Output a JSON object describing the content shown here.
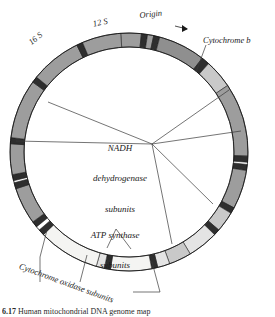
{
  "figure": {
    "caption_label": "6.17",
    "caption_text": "Human mitochondrial DNA genome map"
  },
  "diagram": {
    "type": "circular-genome-map",
    "center": {
      "x": 129,
      "y": 152
    },
    "outer_radius": 119,
    "ring_width": 14,
    "colors": {
      "mid_gray": "#9d9d9d",
      "light_gray": "#c9c9c9",
      "pale_gray": "#e4e4e4",
      "near_white": "#f4f4f2",
      "dark_band": "#2e2e2e",
      "outline": "#1a1a1a",
      "leader_line": "#3a3a3a"
    },
    "labels": [
      {
        "id": "16S",
        "text": "16 S",
        "style": "italic",
        "rotation": -40
      },
      {
        "id": "12S",
        "text": "12 S",
        "style": "italic",
        "rotation": -13
      },
      {
        "id": "origin",
        "text": "Origin",
        "style": "italic",
        "rotation": -6,
        "has_arrow": true
      },
      {
        "id": "cytochrome-b",
        "text": "Cytochrome b",
        "style": "italic",
        "rotation": 0
      },
      {
        "id": "nadh",
        "text": "NADH\ndehydrogenase\nsubunits",
        "style": "italic",
        "rotation": 0
      },
      {
        "id": "atp-synthase",
        "text": "ATP synthase\nsubunits",
        "style": "italic",
        "rotation": 0
      },
      {
        "id": "cytochrome-oxidase",
        "text": "Cytochrome oxidase subunits",
        "style": "italic",
        "rotation": 20
      }
    ],
    "label_text": {
      "rrna_16s": "16 S",
      "rrna_12s": "12 S",
      "origin": "Origin",
      "cytochrome_b": "Cytochrome b",
      "nadh_line1": "NADH",
      "nadh_line2": "dehydrogenase",
      "nadh_line3": "subunits",
      "atp_line1": "ATP synthase",
      "atp_line2": "subunits",
      "cytochrome_oxidase": "Cytochrome oxidase subunits"
    },
    "segments": [
      {
        "name": "origin-region",
        "start_deg": -4,
        "end_deg": 6,
        "fill": "#9d9d9d"
      },
      {
        "name": "tRNA-band-1",
        "start_deg": 6,
        "end_deg": 9,
        "fill": "#2e2e2e"
      },
      {
        "name": "spacer-1",
        "start_deg": 9,
        "end_deg": 12,
        "fill": "#9d9d9d"
      },
      {
        "name": "tRNA-band-2",
        "start_deg": 12,
        "end_deg": 15,
        "fill": "#2e2e2e"
      },
      {
        "name": "cytochrome-b",
        "start_deg": 15,
        "end_deg": 38,
        "fill": "#8f8f8f"
      },
      {
        "name": "tRNA-band-3",
        "start_deg": 38,
        "end_deg": 42,
        "fill": "#2e2e2e"
      },
      {
        "name": "nd6-region",
        "start_deg": 42,
        "end_deg": 56,
        "fill": "#c9c9c9"
      },
      {
        "name": "nd5-region",
        "start_deg": 56,
        "end_deg": 92,
        "fill": "#9d9d9d"
      },
      {
        "name": "tRNA-band-4",
        "start_deg": 92,
        "end_deg": 95,
        "fill": "#2e2e2e"
      },
      {
        "name": "tRNA-band-5",
        "start_deg": 96,
        "end_deg": 99,
        "fill": "#2e2e2e"
      },
      {
        "name": "nd4-region",
        "start_deg": 99,
        "end_deg": 118,
        "fill": "#9d9d9d"
      },
      {
        "name": "tRNA-band-6",
        "start_deg": 118,
        "end_deg": 121,
        "fill": "#2e2e2e"
      },
      {
        "name": "nd4l-region",
        "start_deg": 121,
        "end_deg": 131,
        "fill": "#c9c9c9"
      },
      {
        "name": "tRNA-band-7",
        "start_deg": 131,
        "end_deg": 134,
        "fill": "#2e2e2e"
      },
      {
        "name": "cox3-region",
        "start_deg": 134,
        "end_deg": 149,
        "fill": "#e4e4e4"
      },
      {
        "name": "atp6-region",
        "start_deg": 149,
        "end_deg": 160,
        "fill": "#c9c9c9"
      },
      {
        "name": "atp8-region",
        "start_deg": 160,
        "end_deg": 166,
        "fill": "#e4e4e4"
      },
      {
        "name": "tRNA-band-8",
        "start_deg": 166,
        "end_deg": 169,
        "fill": "#2e2e2e"
      },
      {
        "name": "cox2-region",
        "start_deg": 169,
        "end_deg": 189,
        "fill": "#f4f4f2"
      },
      {
        "name": "tRNA-band-9",
        "start_deg": 189,
        "end_deg": 192,
        "fill": "#2e2e2e"
      },
      {
        "name": "spacer-2",
        "start_deg": 192,
        "end_deg": 196,
        "fill": "#e4e4e4"
      },
      {
        "name": "cox1-region",
        "start_deg": 196,
        "end_deg": 226,
        "fill": "#f4f4f2"
      },
      {
        "name": "tRNA-band-10",
        "start_deg": 226,
        "end_deg": 229,
        "fill": "#2e2e2e"
      },
      {
        "name": "tRNA-band-11",
        "start_deg": 231,
        "end_deg": 234,
        "fill": "#2e2e2e"
      },
      {
        "name": "nd2-region",
        "start_deg": 234,
        "end_deg": 252,
        "fill": "#9d9d9d"
      },
      {
        "name": "tRNA-band-12",
        "start_deg": 252,
        "end_deg": 255,
        "fill": "#2e2e2e"
      },
      {
        "name": "tRNA-band-13",
        "start_deg": 256,
        "end_deg": 259,
        "fill": "#2e2e2e"
      },
      {
        "name": "nd1-region",
        "start_deg": 259,
        "end_deg": 274,
        "fill": "#9d9d9d"
      },
      {
        "name": "tRNA-band-14",
        "start_deg": 274,
        "end_deg": 277,
        "fill": "#2e2e2e"
      },
      {
        "name": "rRNA-16S",
        "start_deg": 277,
        "end_deg": 306,
        "fill": "#9d9d9d"
      },
      {
        "name": "tRNA-band-15",
        "start_deg": 306,
        "end_deg": 309,
        "fill": "#2e2e2e"
      },
      {
        "name": "rRNA-12S",
        "start_deg": 309,
        "end_deg": 334,
        "fill": "#9d9d9d"
      },
      {
        "name": "tRNA-band-16",
        "start_deg": 334,
        "end_deg": 337,
        "fill": "#2e2e2e"
      },
      {
        "name": "d-loop-region",
        "start_deg": 337,
        "end_deg": 356,
        "fill": "#9d9d9d"
      }
    ]
  }
}
